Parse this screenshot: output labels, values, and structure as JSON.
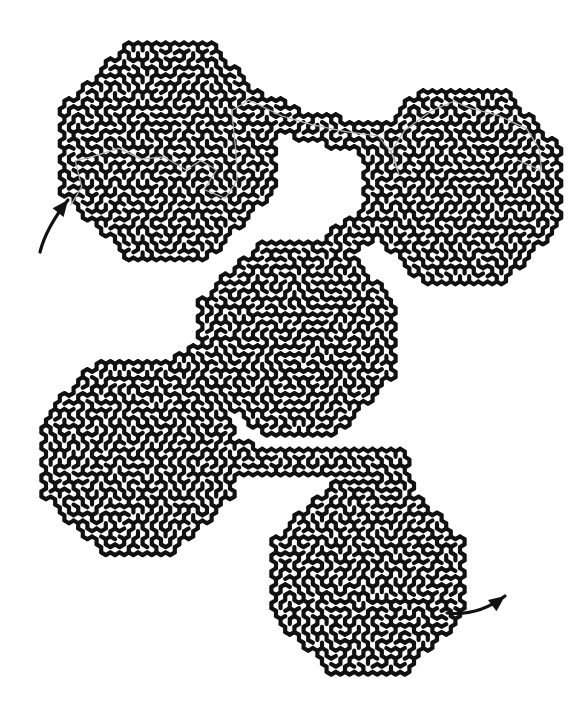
{
  "puzzle": {
    "type": "maze",
    "style": "hexagonal-lattice maze of connected octagonal blobs",
    "colors": {
      "background": "#ffffff",
      "walls": "#111111",
      "solution_trace": "#b8b8b8"
    },
    "regions": [
      {
        "id": "blob-top-left",
        "cx": 168,
        "cy": 150,
        "r": 108
      },
      {
        "id": "blob-top-right",
        "cx": 462,
        "cy": 186,
        "r": 100
      },
      {
        "id": "blob-middle",
        "cx": 298,
        "cy": 338,
        "r": 98
      },
      {
        "id": "blob-bottom-left",
        "cx": 138,
        "cy": 455,
        "r": 98
      },
      {
        "id": "blob-bottom-right",
        "cx": 368,
        "cy": 578,
        "r": 96
      }
    ],
    "corridors": [
      {
        "id": "corridor-top",
        "from": "blob-top-left",
        "to": "blob-top-right",
        "points": [
          [
            240,
            100
          ],
          [
            300,
            125
          ],
          [
            370,
            140
          ],
          [
            400,
            135
          ]
        ],
        "width": 30
      },
      {
        "id": "corridor-right-middle",
        "from": "blob-top-right",
        "to": "blob-middle",
        "points": [
          [
            380,
            215
          ],
          [
            345,
            240
          ],
          [
            320,
            262
          ]
        ],
        "width": 30
      },
      {
        "id": "corridor-middle-left",
        "from": "blob-middle",
        "to": "blob-bottom-left",
        "points": [
          [
            225,
            345
          ],
          [
            190,
            365
          ],
          [
            170,
            380
          ]
        ],
        "width": 34
      },
      {
        "id": "corridor-bottom",
        "from": "blob-bottom-left",
        "to": "blob-bottom-right",
        "points": [
          [
            215,
            455
          ],
          [
            260,
            460
          ],
          [
            330,
            462
          ],
          [
            395,
            465
          ],
          [
            400,
            495
          ]
        ],
        "width": 30
      }
    ],
    "entry": {
      "label": "start",
      "arrow_from": [
        40,
        252
      ],
      "arrow_to": [
        68,
        200
      ]
    },
    "exit": {
      "label": "finish",
      "arrow_from": [
        447,
        613
      ],
      "arrow_to": [
        505,
        596
      ]
    }
  }
}
